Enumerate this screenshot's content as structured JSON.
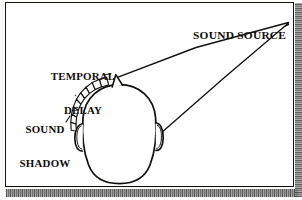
{
  "figure": {
    "type": "line-drawing-diagram",
    "background_color": "#ffffff",
    "ink_color": "#100d0a",
    "frame": {
      "border_color": "#15120f",
      "border_width_px": 1.4
    }
  },
  "labels": {
    "sound_source": {
      "text": "SOUND SOURCE",
      "lines": [
        "SOUND SOURCE"
      ]
    },
    "temporal_delay": {
      "text": "TEMPORAL DELAY",
      "lines": [
        "TEMPORAL",
        "DELAY"
      ]
    },
    "sound_shadow": {
      "text": "SOUND SHADOW",
      "lines": [
        "SOUND",
        "SHADOW"
      ]
    }
  },
  "drawing": {
    "head_outline": "oval head seen from above",
    "nose": "small triangular nose at top of head",
    "left_ear": "small ear on left side of head",
    "right_ear": "small ear on right side of head",
    "sound_shadow_arc": "dashed hatched arc of segments on upper-left of head",
    "ray_to_near_ear": "line from sound source to top/nose of head",
    "ray_to_far_ear": "line from sound source to right ear",
    "source_apex": "convergence point of both rays at upper right"
  },
  "scan_artifacts": {
    "bottom_strip": "dithered gray scanner edge",
    "right_strip": "dithered gray scanner edge"
  }
}
